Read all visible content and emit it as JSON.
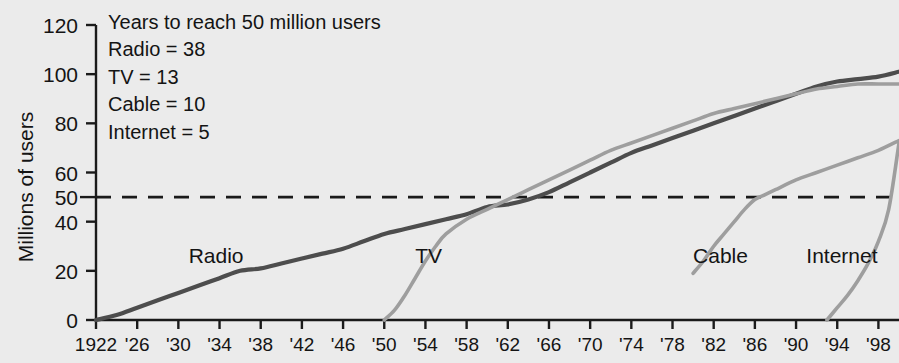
{
  "chart_data": {
    "type": "line",
    "title": "",
    "subtitle": "",
    "xlabel": "",
    "ylabel": "Millions of users",
    "xlim": [
      1922,
      2000
    ],
    "ylim": [
      0,
      120
    ],
    "grid": false,
    "legend_position": "inline-labels",
    "yticks": [
      0,
      20,
      40,
      50,
      60,
      80,
      100,
      120
    ],
    "ytick_labels": [
      "0",
      "20",
      "40",
      "50",
      "60",
      "80",
      "100",
      "120"
    ],
    "xticks": [
      1922,
      1926,
      1930,
      1934,
      1938,
      1942,
      1946,
      1950,
      1954,
      1958,
      1962,
      1966,
      1970,
      1974,
      1978,
      1982,
      1986,
      1990,
      1994,
      1998
    ],
    "xtick_labels": [
      "1922",
      "'26",
      "'30",
      "'34",
      "'38",
      "'42",
      "'46",
      "'50",
      "'54",
      "'58",
      "'62",
      "'66",
      "'70",
      "'74",
      "'78",
      "'82",
      "'86",
      "'90",
      "'94",
      "'98"
    ],
    "reference_line": {
      "y": 50,
      "style": "dashed",
      "color": "#1a1a1a",
      "label": "50 million users"
    },
    "series": [
      {
        "name": "Radio",
        "color": "#4d4d4d",
        "label_x": 1931,
        "label_y": 26,
        "x": [
          1922,
          1924,
          1926,
          1928,
          1930,
          1932,
          1934,
          1936,
          1938,
          1940,
          1942,
          1944,
          1946,
          1948,
          1950,
          1952,
          1954,
          1956,
          1958,
          1960,
          1962,
          1964,
          1966,
          1968,
          1970,
          1972,
          1974,
          1976,
          1978,
          1980,
          1982,
          1984,
          1986,
          1988,
          1990,
          1992,
          1994,
          1996,
          1998,
          2000
        ],
        "y": [
          0,
          2,
          5,
          8,
          11,
          14,
          17,
          20,
          21,
          23,
          25,
          27,
          29,
          32,
          35,
          37,
          39,
          41,
          43,
          46,
          47,
          49,
          52,
          56,
          60,
          64,
          68,
          71,
          74,
          77,
          80,
          83,
          86,
          89,
          92,
          95,
          97,
          98,
          99,
          101
        ]
      },
      {
        "name": "TV",
        "color": "#9e9e9e",
        "label_x": 1953,
        "label_y": 26,
        "x": [
          1950,
          1951,
          1952,
          1953,
          1954,
          1955,
          1956,
          1958,
          1960,
          1962,
          1964,
          1966,
          1968,
          1970,
          1972,
          1974,
          1976,
          1978,
          1980,
          1982,
          1984,
          1986,
          1988,
          1990,
          1992,
          1994,
          1996,
          1998,
          2000
        ],
        "y": [
          0,
          4,
          10,
          17,
          24,
          30,
          35,
          41,
          45,
          49,
          53,
          57,
          61,
          65,
          69,
          72,
          75,
          78,
          81,
          84,
          86,
          88,
          90,
          92,
          94,
          95,
          96,
          96,
          96
        ]
      },
      {
        "name": "Cable",
        "color": "#9e9e9e",
        "label_x": 1980,
        "label_y": 26,
        "x": [
          1980,
          1981,
          1982,
          1983,
          1984,
          1985,
          1986,
          1987,
          1988,
          1990,
          1992,
          1994,
          1996,
          1998,
          2000
        ],
        "y": [
          19,
          24,
          30,
          35,
          40,
          45,
          49,
          51,
          53,
          57,
          60,
          63,
          66,
          69,
          73
        ]
      },
      {
        "name": "Internet",
        "color": "#9e9e9e",
        "label_x": 1991,
        "label_y": 26,
        "x": [
          1993,
          1994,
          1995,
          1996,
          1997,
          1998,
          1999,
          2000
        ],
        "y": [
          0,
          5,
          10,
          16,
          23,
          32,
          45,
          72
        ]
      }
    ],
    "annotation": {
      "heading": "Years to reach 50 million users",
      "lines": [
        "Radio = 38",
        "TV = 13",
        "Cable = 10",
        "Internet = 5"
      ]
    }
  }
}
